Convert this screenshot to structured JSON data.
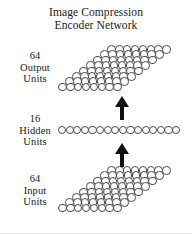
{
  "figure": {
    "title_line1": "Image Compression",
    "title_line2": "Encoder Network",
    "background_color": "#ffffff",
    "ink_color": "#1a1a1a",
    "unit_outline_color": "#4a4a4a",
    "arrow_color": "#111111"
  },
  "layers": {
    "output": {
      "count_label": "64",
      "name_label": "Output",
      "unit_label": "Units",
      "unit_count": 64,
      "rows": 8,
      "columns": 8,
      "shape": "skewed-parallelogram-grid"
    },
    "hidden": {
      "count_label": "16",
      "name_label": "Hidden",
      "unit_label": "Units",
      "unit_count": 16,
      "rows": 1,
      "columns": 16,
      "shape": "single-row"
    },
    "input": {
      "count_label": "64",
      "name_label": "Input",
      "unit_label": "Units",
      "unit_count": 64,
      "rows": 8,
      "columns": 8,
      "shape": "skewed-parallelogram-grid"
    }
  },
  "connections": [
    {
      "id": "input-to-hidden",
      "from": "input",
      "to": "hidden",
      "direction": "up",
      "style": "solid-filled-arrow"
    },
    {
      "id": "hidden-to-output",
      "from": "hidden",
      "to": "output",
      "direction": "up",
      "style": "solid-filled-arrow"
    }
  ]
}
